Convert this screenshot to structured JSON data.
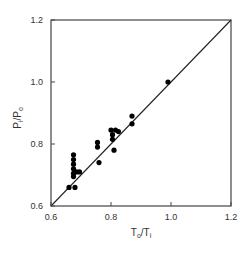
{
  "chart_data": {
    "type": "scatter",
    "title": "",
    "xlabel": "T_o / T_i",
    "ylabel": "P_i / P_o",
    "xlabel_parts": {
      "main1": "T",
      "sub1": "o",
      "sep": "/",
      "main2": "T",
      "sub2": "i"
    },
    "ylabel_parts": {
      "main1": "P",
      "sub1": "i",
      "sep": "/",
      "main2": "P",
      "sub2": "o"
    },
    "xlim": [
      0.6,
      1.2
    ],
    "ylim": [
      0.6,
      1.2
    ],
    "x_ticks": [
      "0.6",
      "0.8",
      "1.0",
      "1.2"
    ],
    "y_ticks": [
      "0.6",
      "0.8",
      "1.0",
      "1.2"
    ],
    "grid": false,
    "legend": null,
    "reference_line": {
      "label": "y = x",
      "from": [
        0.6,
        0.6
      ],
      "to": [
        1.2,
        1.2
      ]
    },
    "series": [
      {
        "name": "data",
        "marker": "filled-circle",
        "color": "#000000",
        "points": [
          {
            "x": 0.66,
            "y": 0.66
          },
          {
            "x": 0.68,
            "y": 0.66
          },
          {
            "x": 0.675,
            "y": 0.765
          },
          {
            "x": 0.675,
            "y": 0.75
          },
          {
            "x": 0.675,
            "y": 0.735
          },
          {
            "x": 0.675,
            "y": 0.72
          },
          {
            "x": 0.675,
            "y": 0.705
          },
          {
            "x": 0.675,
            "y": 0.695
          },
          {
            "x": 0.685,
            "y": 0.71
          },
          {
            "x": 0.695,
            "y": 0.71
          },
          {
            "x": 0.755,
            "y": 0.805
          },
          {
            "x": 0.755,
            "y": 0.79
          },
          {
            "x": 0.76,
            "y": 0.74
          },
          {
            "x": 0.8,
            "y": 0.845
          },
          {
            "x": 0.805,
            "y": 0.83
          },
          {
            "x": 0.805,
            "y": 0.815
          },
          {
            "x": 0.81,
            "y": 0.78
          },
          {
            "x": 0.815,
            "y": 0.845
          },
          {
            "x": 0.825,
            "y": 0.84
          },
          {
            "x": 0.87,
            "y": 0.89
          },
          {
            "x": 0.87,
            "y": 0.865
          },
          {
            "x": 0.99,
            "y": 1.0
          }
        ]
      }
    ]
  }
}
